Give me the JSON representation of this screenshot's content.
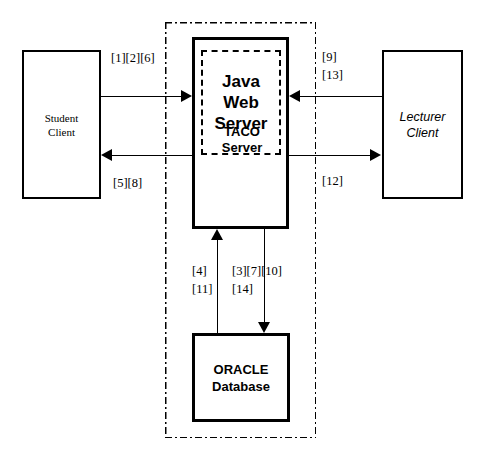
{
  "diagram": {
    "type": "system-architecture-block-diagram",
    "nodes": {
      "student_client": {
        "label": "Student\nClient",
        "style": "serif"
      },
      "lecturer_client": {
        "label": "Lecturer\nClient",
        "style": "sans-italic"
      },
      "taco_server": {
        "label": "TACO\nServer",
        "style": "sans-bold"
      },
      "java_web_server": {
        "label": "Java\nWeb\nServer",
        "style": "sans-bold-large"
      },
      "oracle_database": {
        "label": "ORACLE\nDatabase",
        "style": "sans-bold"
      }
    },
    "boundary": {
      "name": "server-boundary",
      "line_style": "dash-dot"
    },
    "flow_labels": {
      "student_to_server": "[1][2][6]",
      "server_to_student": "[5][8]",
      "lecturer_to_server_line1": "[9]",
      "lecturer_to_server_line2": "[13]",
      "server_to_lecturer": "[12]",
      "db_to_server_line1": "[4]",
      "db_to_server_line2": "[11]",
      "server_to_db_line1": "[3][7][10]",
      "server_to_db_line2": "[14]"
    },
    "colors": {
      "stroke": "#000000",
      "background": "#ffffff"
    }
  }
}
